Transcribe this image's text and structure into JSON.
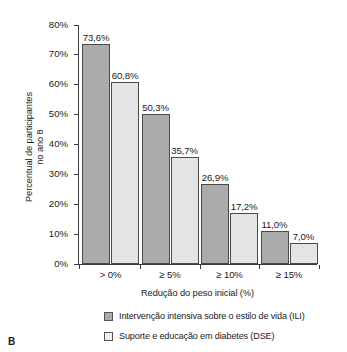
{
  "panel": {
    "letter": "B"
  },
  "chart_data": {
    "type": "bar",
    "title": "",
    "xlabel": "Redução do peso inicial (%)",
    "ylabel": "Percentual de participantes\nno ano 8",
    "categories": [
      "> 0%",
      "≥ 5%",
      "≥ 10%",
      "≥ 15%"
    ],
    "ylim": [
      0,
      80
    ],
    "ytick_values": [
      0,
      10,
      20,
      30,
      40,
      50,
      60,
      70,
      80
    ],
    "ytick_labels": [
      "0%",
      "10%",
      "20%",
      "30%",
      "40%",
      "50%",
      "60%",
      "70%",
      "80%"
    ],
    "grid": false,
    "legend_position": "bottom-center",
    "series": [
      {
        "name": "Intervenção intensiva sobre o estilo de vida (ILI)",
        "short": "ILI",
        "color": "#ababab",
        "values": [
          73.6,
          50.3,
          26.9,
          11.0
        ],
        "labels": [
          "73,6%",
          "50,3%",
          "26,9%",
          "11,0%"
        ]
      },
      {
        "name": "Suporte e educação em diabetes (DSE)",
        "short": "DSE",
        "color": "#e4e4e4",
        "values": [
          60.8,
          35.7,
          17.2,
          7.0
        ],
        "labels": [
          "60,8%",
          "35,7%",
          "17,2%",
          "7,0%"
        ]
      }
    ]
  }
}
